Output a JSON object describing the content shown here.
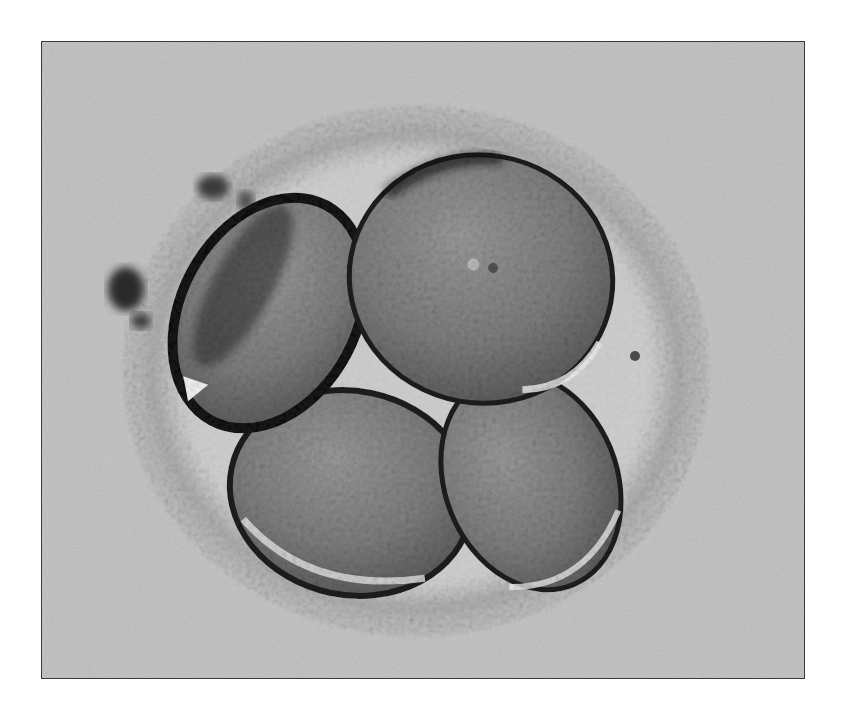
{
  "image": {
    "subject": "four-cell embryo micrograph",
    "mode": "grayscale",
    "colors": {
      "background": "#c6c6c6",
      "frame_border": "#3a3a3a",
      "zona": "#bdbdbd",
      "perivitelline_space": "#cfcfcf",
      "cytoplasm": "#8a8a8a",
      "membrane_dark": "#1e1e1e",
      "highlight": "#f0f0f0"
    },
    "blastomere_count": 4,
    "structures": {
      "zona_pellucida": {
        "cx": 415,
        "cy": 370,
        "rx": 300,
        "ry": 272
      },
      "blastomeres": [
        {
          "name": "top-right",
          "cx": 480,
          "cy": 278,
          "rx": 132,
          "ry": 124,
          "rotate": 10
        },
        {
          "name": "left",
          "cx": 268,
          "cy": 312,
          "rx": 88,
          "ry": 122,
          "rotate": 28
        },
        {
          "name": "bottom-left",
          "cx": 350,
          "cy": 492,
          "rx": 122,
          "ry": 102,
          "rotate": 12
        },
        {
          "name": "bottom-right",
          "cx": 530,
          "cy": 480,
          "rx": 86,
          "ry": 112,
          "rotate": -22
        }
      ],
      "debris": [
        {
          "cx": 125,
          "cy": 288,
          "r": 16
        },
        {
          "cx": 210,
          "cy": 185,
          "r": 14
        }
      ]
    }
  }
}
